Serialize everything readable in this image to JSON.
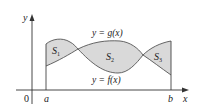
{
  "diagram": {
    "axes": {
      "x_label": "x",
      "y_label": "y",
      "origin_label": "0"
    },
    "bounds": {
      "left": "a",
      "right": "b"
    },
    "curves": {
      "upper_label": "y = g(x)",
      "lower_label": "y = f(x)"
    },
    "regions": [
      {
        "name": "S",
        "sub": "1"
      },
      {
        "name": "S",
        "sub": "2"
      },
      {
        "name": "S",
        "sub": "3"
      }
    ],
    "colors": {
      "fill": "#d9d9d9",
      "stroke": "#555555",
      "axis": "#333333",
      "text": "#222222"
    }
  }
}
